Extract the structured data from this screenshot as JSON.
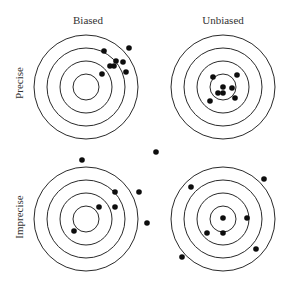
{
  "diagram": {
    "column_labels": [
      "Biased",
      "Unbiased"
    ],
    "row_labels": [
      "Precise",
      "Imprecise"
    ],
    "colors": {
      "ring": "#2a2a2a",
      "shot": "#0d0d0d",
      "text": "#333333",
      "background": "#ffffff"
    },
    "ring_radii": [
      52,
      39,
      26,
      13
    ],
    "shot_radius": 2.8,
    "targets": [
      {
        "name": "biased-precise",
        "column": "Biased",
        "row": "Precise",
        "center": [
          86,
          87
        ],
        "shots": [
          [
            104,
            51
          ],
          [
            129,
            48
          ],
          [
            116,
            61
          ],
          [
            123,
            62
          ],
          [
            110,
            66
          ],
          [
            114,
            66
          ],
          [
            126,
            72
          ],
          [
            102,
            74
          ]
        ]
      },
      {
        "name": "unbiased-precise",
        "column": "Unbiased",
        "row": "Precise",
        "center": [
          223,
          87
        ],
        "shots": [
          [
            213,
            77
          ],
          [
            237,
            75
          ],
          [
            223,
            87
          ],
          [
            232,
            88
          ],
          [
            218,
            93
          ],
          [
            223,
            93
          ],
          [
            235,
            98
          ],
          [
            210,
            101
          ]
        ]
      },
      {
        "name": "biased-imprecise",
        "column": "Biased",
        "row": "Imprecise",
        "center": [
          86,
          219
        ],
        "shots": [
          [
            82,
            160
          ],
          [
            156,
            152
          ],
          [
            115,
            192
          ],
          [
            139,
            192
          ],
          [
            99,
            207
          ],
          [
            115,
            207
          ],
          [
            147,
            223
          ],
          [
            74,
            231
          ]
        ]
      },
      {
        "name": "unbiased-imprecise",
        "column": "Unbiased",
        "row": "Imprecise",
        "center": [
          223,
          219
        ],
        "shots": [
          [
            264,
            179
          ],
          [
            191,
            187
          ],
          [
            223,
            218
          ],
          [
            247,
            218
          ],
          [
            207,
            233
          ],
          [
            223,
            233
          ],
          [
            256,
            249
          ],
          [
            182,
            257
          ]
        ]
      }
    ]
  }
}
